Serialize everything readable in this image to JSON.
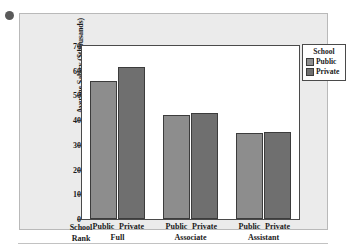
{
  "chart_data": {
    "type": "bar",
    "title": "",
    "xlabel": "School Rank",
    "ylabel": "Average Salary ($thousands)",
    "categories": [
      "Full",
      "Associate",
      "Assistant"
    ],
    "series": [
      {
        "name": "Public",
        "values": [
          56,
          42,
          35
        ],
        "color": "#8d8d8d"
      },
      {
        "name": "Private",
        "values": [
          61.5,
          43,
          35.3
        ],
        "color": "#6f6f6f"
      }
    ],
    "ylim": [
      0,
      70
    ],
    "yticks": [
      0,
      10,
      20,
      30,
      40,
      50,
      60,
      70
    ],
    "grid": false,
    "legend_position": "right",
    "legend_title": "School",
    "series_tick_labels": [
      "Public",
      "Private",
      "Public",
      "Private",
      "Public",
      "Private"
    ]
  },
  "legend": {
    "title": "School",
    "entries": [
      {
        "label": "Public",
        "color": "#8d8d8d"
      },
      {
        "label": "Private",
        "color": "#6f6f6f"
      }
    ]
  },
  "axes": {
    "y_title": "Average Salary ($thousands)",
    "x_title_line1": "School",
    "x_title_line2": "Rank"
  },
  "icons": {
    "bullet": "bullet-dot"
  }
}
